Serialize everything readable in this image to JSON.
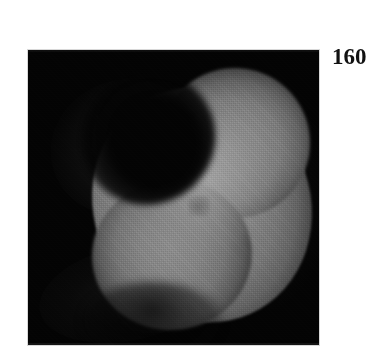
{
  "figure": {
    "background_color": "#ffffff",
    "width": 377,
    "height": 363,
    "alt_description": "Grayscale scientific imaging panel showing a bright kidney-shaped specimen on a black field, labelled 160"
  },
  "panel": {
    "name": "image-panel",
    "background_color": "#030303",
    "left": 28,
    "top": 50,
    "width": 291,
    "height": 295
  },
  "specimen": {
    "shape": "kidney-bean",
    "interior_color": "#808080",
    "core_highlight_color": "#a8a8a8",
    "edge_falloff": "soft-diffuse",
    "notch_position": "upper-left"
  },
  "label": {
    "text": "160",
    "color": "#111111",
    "left": 332,
    "top": 45
  }
}
